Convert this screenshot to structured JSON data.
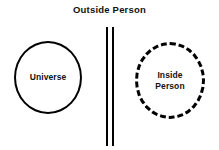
{
  "diagram": {
    "title": "Outside Person",
    "background_color": "#ffffff",
    "stroke_color": "#000000",
    "shapes": {
      "universe": {
        "label": "Universe",
        "border_style": "solid"
      },
      "inside_person": {
        "label_line_1": "Inside",
        "label_line_2": "Person",
        "border_style": "dashed"
      }
    },
    "barrier": {
      "name": "double-vertical-line",
      "line_count": 2
    }
  }
}
